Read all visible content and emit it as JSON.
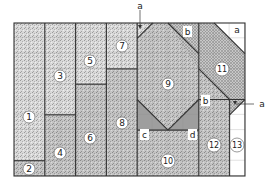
{
  "diagram": {
    "type": "quilt-cutting-layout",
    "grid": {
      "columns": 15,
      "rows": 10
    },
    "regions": [
      {
        "id": "1",
        "label": "1",
        "fill": "stipple-light"
      },
      {
        "id": "2",
        "label": "2",
        "fill": "stipple-medium"
      },
      {
        "id": "3",
        "label": "3",
        "fill": "stipple-light"
      },
      {
        "id": "4",
        "label": "4",
        "fill": "stipple-medium"
      },
      {
        "id": "5",
        "label": "5",
        "fill": "stipple-light"
      },
      {
        "id": "6",
        "label": "6",
        "fill": "stipple-medium"
      },
      {
        "id": "7",
        "label": "7",
        "fill": "stipple-light"
      },
      {
        "id": "8",
        "label": "8",
        "fill": "stipple-medium"
      },
      {
        "id": "9",
        "label": "9",
        "fill": "stipple-medium"
      },
      {
        "id": "10",
        "label": "10",
        "fill": "stipple-medium"
      },
      {
        "id": "11",
        "label": "11",
        "fill": "crosshatch"
      },
      {
        "id": "12",
        "label": "12",
        "fill": "stipple-medium"
      },
      {
        "id": "13",
        "label": "13",
        "fill": "white"
      }
    ],
    "triangle_labels": {
      "a_top": "a",
      "a_corner": "a",
      "a_right": "a",
      "b_top": "b",
      "b_mid": "b",
      "c": "c",
      "d": "d"
    }
  }
}
